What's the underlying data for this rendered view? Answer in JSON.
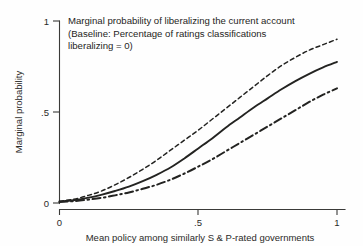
{
  "chart_data": {
    "type": "line",
    "title": "Marginal probability of liberalizing the current account (Baseline: Percentage of ratings classifications liberalizing = 0)",
    "title_lines": [
      "Marginal probability of liberalizing the current account",
      "(Baseline: Percentage of ratings classifications",
      "liberalizing = 0)"
    ],
    "xlabel": "Mean policy among similarly S & P-rated governments",
    "ylabel": "Marginal probability",
    "xlim": [
      0,
      1
    ],
    "ylim": [
      0,
      1
    ],
    "grid": false,
    "legend": "none",
    "xticks": [
      "0",
      ".5",
      "1"
    ],
    "xtick_values": [
      0,
      0.5,
      1
    ],
    "yticks": [
      "0",
      ".5",
      "1"
    ],
    "ytick_values": [
      0,
      0.5,
      1
    ],
    "x": [
      0,
      0.05,
      0.1,
      0.15,
      0.2,
      0.25,
      0.3,
      0.35,
      0.4,
      0.45,
      0.5,
      0.55,
      0.6,
      0.65,
      0.7,
      0.75,
      0.8,
      0.85,
      0.9,
      0.95,
      1
    ],
    "series": [
      {
        "name": "upper confidence bound",
        "style": "short-dashed",
        "color": "#232321",
        "values": [
          0.01,
          0.02,
          0.04,
          0.065,
          0.1,
          0.14,
          0.185,
          0.235,
          0.29,
          0.345,
          0.4,
          0.46,
          0.52,
          0.58,
          0.64,
          0.7,
          0.755,
          0.8,
          0.84,
          0.87,
          0.9
        ]
      },
      {
        "name": "point estimate",
        "style": "solid",
        "color": "#232321",
        "values": [
          0.008,
          0.015,
          0.028,
          0.045,
          0.066,
          0.09,
          0.12,
          0.155,
          0.195,
          0.245,
          0.3,
          0.355,
          0.415,
          0.47,
          0.525,
          0.575,
          0.625,
          0.67,
          0.71,
          0.745,
          0.775
        ]
      },
      {
        "name": "lower confidence bound",
        "style": "dash-dot",
        "color": "#232321",
        "values": [
          0.005,
          0.01,
          0.018,
          0.028,
          0.042,
          0.058,
          0.078,
          0.1,
          0.128,
          0.162,
          0.2,
          0.24,
          0.285,
          0.33,
          0.375,
          0.42,
          0.465,
          0.51,
          0.555,
          0.595,
          0.63
        ]
      }
    ]
  }
}
